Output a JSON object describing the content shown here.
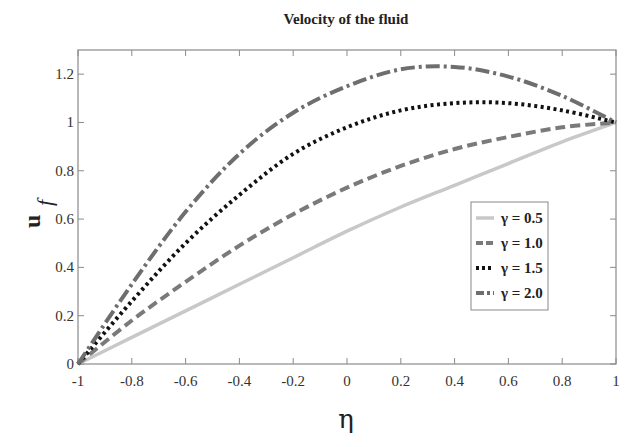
{
  "chart_data": {
    "type": "line",
    "title": "Velocity of the fluid",
    "xlabel": "η",
    "ylabel": "u",
    "ylabel_subscript": "f",
    "xlim": [
      -1,
      1
    ],
    "ylim": [
      0,
      1.3
    ],
    "grid": false,
    "legend_position": "center-right",
    "x_ticks": [
      -1,
      -0.8,
      -0.6,
      -0.4,
      -0.2,
      0,
      0.2,
      0.4,
      0.6,
      0.8,
      1
    ],
    "x_tick_labels": [
      "-1",
      "-0.8",
      "-0.6",
      "-0.4",
      "-0.2",
      "0",
      "0.2",
      "0.4",
      "0.6",
      "0.8",
      "1"
    ],
    "y_ticks": [
      0,
      0.2,
      0.4,
      0.6,
      0.8,
      1,
      1.2
    ],
    "y_tick_labels": [
      "0",
      "0.2",
      "0.4",
      "0.6",
      "0.8",
      "1",
      "1.2"
    ],
    "x": [
      -1,
      -0.8,
      -0.6,
      -0.4,
      -0.2,
      0,
      0.2,
      0.4,
      0.6,
      0.8,
      1
    ],
    "series": [
      {
        "name": "γ = 0.5",
        "style": "solid",
        "color": "#c8c8c8",
        "values": [
          0,
          0.11,
          0.22,
          0.33,
          0.44,
          0.55,
          0.65,
          0.74,
          0.83,
          0.92,
          1.0
        ]
      },
      {
        "name": "γ = 1.0",
        "style": "dashed",
        "color": "#7a7a7a",
        "values": [
          0,
          0.18,
          0.34,
          0.49,
          0.62,
          0.73,
          0.82,
          0.89,
          0.94,
          0.98,
          1.0
        ]
      },
      {
        "name": "γ = 1.5",
        "style": "dotted",
        "color": "#111111",
        "values": [
          0,
          0.26,
          0.5,
          0.7,
          0.87,
          0.98,
          1.05,
          1.08,
          1.08,
          1.05,
          1.0
        ]
      },
      {
        "name": "γ = 2.0",
        "style": "dashdot",
        "color": "#6e6e6e",
        "values": [
          0,
          0.33,
          0.63,
          0.87,
          1.04,
          1.15,
          1.22,
          1.23,
          1.19,
          1.11,
          1.0
        ]
      }
    ]
  },
  "legend": {
    "items": [
      {
        "label": "γ = 0.5"
      },
      {
        "label": "γ = 1.0"
      },
      {
        "label": "γ = 1.5"
      },
      {
        "label": "γ = 2.0"
      }
    ]
  }
}
